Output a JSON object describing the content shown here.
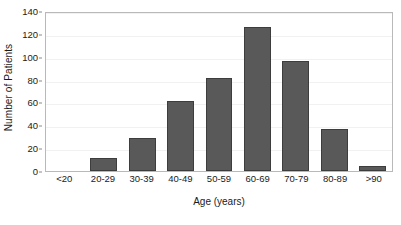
{
  "chart_data": {
    "type": "bar",
    "title": "",
    "xlabel": "Age (years)",
    "ylabel": "Number of Patients",
    "categories": [
      "<20",
      "20-29",
      "30-39",
      "40-49",
      "50-59",
      "60-69",
      "70-79",
      "80-89",
      ">90"
    ],
    "values": [
      0,
      11,
      29,
      61,
      81,
      126,
      96,
      37,
      4
    ],
    "ylim": [
      0,
      140
    ],
    "yticks": [
      0,
      20,
      40,
      60,
      80,
      100,
      120,
      140
    ],
    "ytick_labels": [
      "0",
      "20",
      "40",
      "60",
      "80",
      "100",
      "120",
      "140"
    ],
    "grid": true,
    "grid_axis": "y",
    "legend": false,
    "legend_position": "none",
    "bar_color": "#595959",
    "bar_edge_color": "#3d3d3d",
    "grid_color": "#f1f1f1",
    "frame_color": "#b9b9b9",
    "background_color": "#ffffff",
    "text_color": "#1a1a1a"
  }
}
